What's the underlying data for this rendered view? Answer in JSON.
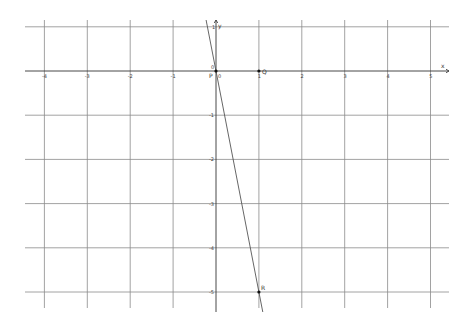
{
  "graph": {
    "origin_px": [
      216,
      71
    ],
    "unit_x_px": 42.9,
    "unit_y_px": 44.2,
    "x_range": [
      -4,
      5
    ],
    "y_range": [
      -5,
      1
    ],
    "grid_color": "#8a8a8a",
    "axis_color": "#333333",
    "line_color": "#555555",
    "point_color": "#111111",
    "x_axis_label": "x",
    "y_axis_label": "y",
    "x_ticks": [
      {
        "value": -4,
        "label": "-4"
      },
      {
        "value": -3,
        "label": "-3"
      },
      {
        "value": -2,
        "label": "-2"
      },
      {
        "value": -1,
        "label": "-1"
      },
      {
        "value": 0,
        "label": "0"
      },
      {
        "value": 1,
        "label": "1"
      },
      {
        "value": 2,
        "label": "2"
      },
      {
        "value": 3,
        "label": "3"
      },
      {
        "value": 4,
        "label": "4"
      },
      {
        "value": 5,
        "label": "5"
      }
    ],
    "y_ticks": [
      {
        "value": 1,
        "label": "1"
      },
      {
        "value": 0,
        "label": "0"
      },
      {
        "value": -1,
        "label": "-1"
      },
      {
        "value": -2,
        "label": "-2"
      },
      {
        "value": -3,
        "label": "-3"
      },
      {
        "value": -4,
        "label": "-4"
      },
      {
        "value": -5,
        "label": "-5"
      }
    ],
    "points": [
      {
        "name": "P",
        "x": 0,
        "y": 0
      },
      {
        "name": "Q",
        "x": 1,
        "y": 0
      },
      {
        "name": "R",
        "x": 1,
        "y": -5
      }
    ],
    "line": {
      "equation": "y = -5x",
      "through": [
        "P",
        "R"
      ]
    }
  }
}
